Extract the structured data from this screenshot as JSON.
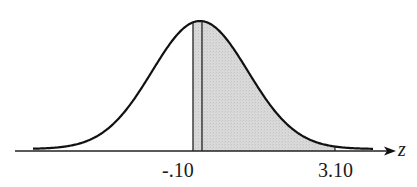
{
  "diagram": {
    "type": "normal-distribution-curve",
    "axis_variable": "z",
    "labels": [
      {
        "text": "-.10",
        "x_px": 193
      },
      {
        "text": "3.10",
        "x_px": 335
      }
    ],
    "shaded_region": {
      "from_label": "-.10",
      "to_label": "3.10",
      "fill_color": "#d9d9d9"
    },
    "unlabelled_vertical_line_x_px": 202,
    "curve_color": "#111111",
    "axis_color": "#222222"
  }
}
